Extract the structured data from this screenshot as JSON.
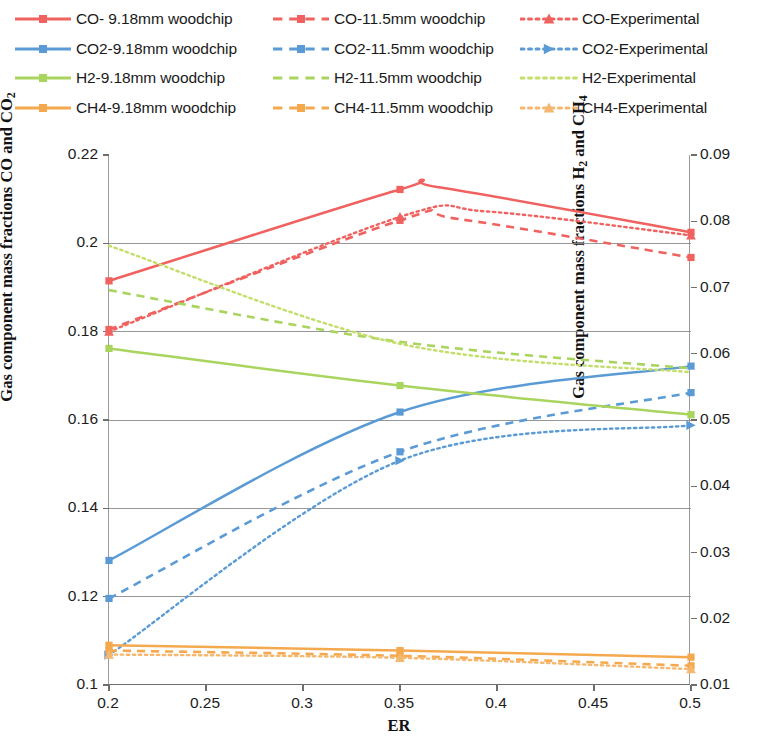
{
  "chart_data": {
    "type": "line",
    "title": "",
    "xlabel": "ER",
    "ylabel_left": "Gas component mass fractions CO and CO2",
    "ylabel_right": "Gas component mass fractions H2 and CH4",
    "x": [
      0.2,
      0.35,
      0.5
    ],
    "xlim": [
      0.2,
      0.5
    ],
    "xticks": [
      "0.2",
      "0.25",
      "0.3",
      "0.35",
      "0.4",
      "0.45",
      "0.5"
    ],
    "xtick_values": [
      0.2,
      0.25,
      0.3,
      0.35,
      0.4,
      0.45,
      0.5
    ],
    "ylim_left": [
      0.1,
      0.22
    ],
    "yticks_left": [
      "0.1",
      "0.12",
      "0.14",
      "0.16",
      "0.18",
      "0.2",
      "0.22"
    ],
    "ytick_values_left": [
      0.1,
      0.12,
      0.14,
      0.16,
      0.18,
      0.2,
      0.22
    ],
    "ylim_right": [
      0.01,
      0.09
    ],
    "yticks_right": [
      "0.01",
      "0.02",
      "0.03",
      "0.04",
      "0.05",
      "0.06",
      "0.07",
      "0.08",
      "0.09"
    ],
    "ytick_values_right": [
      0.01,
      0.02,
      0.03,
      0.04,
      0.05,
      0.06,
      0.07,
      0.08,
      0.09
    ],
    "grid": true,
    "legend_position": "top",
    "series": [
      {
        "name": "CO- 9.18mm woodchip",
        "axis": "left",
        "color": "#F0625F",
        "style": "solid",
        "marker": "square",
        "values": [
          0.1915,
          0.2122,
          0.2025
        ],
        "peak": {
          "x": 0.37,
          "y": 0.2127
        }
      },
      {
        "name": "CO-11.5mm woodchip",
        "axis": "left",
        "color": "#F0625F",
        "style": "dashed",
        "marker": "square",
        "values": [
          0.1805,
          0.2052,
          0.1968
        ],
        "peak": {
          "x": 0.38,
          "y": 0.2055
        }
      },
      {
        "name": "CO-Experimental",
        "axis": "left",
        "color": "#F0625F",
        "style": "dotted",
        "marker": "triangle",
        "values": [
          0.18,
          0.206,
          0.2018
        ],
        "peak": {
          "x": 0.395,
          "y": 0.2072
        }
      },
      {
        "name": "CO2-9.18mm woodchip",
        "axis": "left",
        "color": "#5B9BD5",
        "style": "solid",
        "marker": "square",
        "values": [
          0.1282,
          0.1618,
          0.1722
        ],
        "peak": null
      },
      {
        "name": "CO2-11.5mm woodchip",
        "axis": "left",
        "color": "#5B9BD5",
        "style": "dashed",
        "marker": "square",
        "values": [
          0.1196,
          0.1528,
          0.1662
        ],
        "peak": null
      },
      {
        "name": "CO2-Experimental",
        "axis": "left",
        "color": "#5B9BD5",
        "style": "dotted",
        "marker": "arrow",
        "values": [
          0.1068,
          0.1508,
          0.1588
        ],
        "peak": null
      },
      {
        "name": "H2-9.18mm woodchip",
        "axis": "right",
        "color": "#A9D45E",
        "style": "solid",
        "marker": "square",
        "values": [
          0.0608,
          0.0552,
          0.0508
        ],
        "peak": null
      },
      {
        "name": "H2-11.5mm woodchip",
        "axis": "right",
        "color": "#A9D45E",
        "style": "dashed",
        "marker": "none",
        "values": [
          0.0696,
          0.0618,
          0.0578
        ],
        "peak": null
      },
      {
        "name": "H2-Experimental",
        "axis": "right",
        "color": "#C3DE6A",
        "style": "dotted",
        "marker": "none",
        "values": [
          0.0763,
          0.0615,
          0.0572
        ],
        "peak": null
      },
      {
        "name": "CH4-9.18mm woodchip",
        "axis": "right",
        "color": "#F5A94E",
        "style": "solid",
        "marker": "square",
        "values": [
          0.016,
          0.0152,
          0.0142
        ],
        "peak": null
      },
      {
        "name": "CH4-11.5mm woodchip",
        "axis": "right",
        "color": "#F5A94E",
        "style": "dashed",
        "marker": "square",
        "values": [
          0.0152,
          0.0144,
          0.0129
        ],
        "peak": null
      },
      {
        "name": "CH4-Experimental",
        "axis": "right",
        "color": "#F5B871",
        "style": "dotted",
        "marker": "triangle",
        "values": [
          0.0146,
          0.0141,
          0.0124
        ],
        "peak": null
      }
    ]
  },
  "legend": {
    "columns": [
      [
        {
          "label": "CO- 9.18mm woodchip",
          "color": "#F0625F",
          "style": "solid",
          "marker": "square"
        },
        {
          "label": "CO2-9.18mm woodchip",
          "color": "#5B9BD5",
          "style": "solid",
          "marker": "square"
        },
        {
          "label": "H2-9.18mm woodchip",
          "color": "#A9D45E",
          "style": "solid",
          "marker": "square"
        },
        {
          "label": "CH4-9.18mm woodchip",
          "color": "#F5A94E",
          "style": "solid",
          "marker": "square"
        }
      ],
      [
        {
          "label": "CO-11.5mm woodchip",
          "color": "#F0625F",
          "style": "dashed",
          "marker": "square"
        },
        {
          "label": "CO2-11.5mm woodchip",
          "color": "#5B9BD5",
          "style": "dashed",
          "marker": "square"
        },
        {
          "label": "H2-11.5mm woodchip",
          "color": "#A9D45E",
          "style": "dashed",
          "marker": "none"
        },
        {
          "label": "CH4-11.5mm woodchip",
          "color": "#F5A94E",
          "style": "dashed",
          "marker": "square"
        }
      ],
      [
        {
          "label": "CO-Experimental",
          "color": "#F0625F",
          "style": "dotted",
          "marker": "triangle"
        },
        {
          "label": "CO2-Experimental",
          "color": "#5B9BD5",
          "style": "dotted",
          "marker": "arrow"
        },
        {
          "label": "H2-Experimental",
          "color": "#C3DE6A",
          "style": "dotted",
          "marker": "none"
        },
        {
          "label": "CH4-Experimental",
          "color": "#F5B871",
          "style": "dotted",
          "marker": "triangle"
        }
      ]
    ]
  },
  "axes": {
    "left_label_parts": {
      "pre": "Gas component mass fractions CO and CO",
      "sub": "2",
      "post": ""
    },
    "right_label_parts": {
      "pre": "Gas component mass fractions H",
      "sub": "2",
      "mid": " and CH",
      "sub2": "4",
      "post": ""
    },
    "x_label": "ER"
  },
  "colors": {
    "co": "#F0625F",
    "co2": "#5B9BD5",
    "h2": "#A9D45E",
    "h2_exp": "#C3DE6A",
    "ch4": "#F5A94E",
    "ch4_exp": "#F5B871",
    "grid": "#8c8c8c",
    "axis": "#6e6e6e",
    "text": "#1a1a1a"
  }
}
